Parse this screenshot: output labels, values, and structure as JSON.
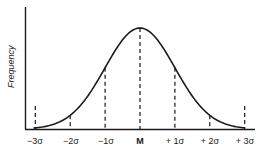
{
  "chart_data": {
    "type": "line",
    "title": "",
    "xlabel": "",
    "ylabel": "Frequency",
    "categories": [
      "-3σ",
      "-2σ",
      "-1σ",
      "M",
      "+1σ",
      "+2σ",
      "+3σ"
    ],
    "x": [
      -3,
      -2,
      -1,
      0,
      1,
      2,
      3
    ],
    "series": [
      {
        "name": "Normal curve",
        "values": [
          0.004,
          0.054,
          0.242,
          0.399,
          0.242,
          0.054,
          0.004
        ]
      }
    ],
    "xlim": [
      -3.3,
      3.1
    ],
    "ylim": [
      0,
      0.42
    ],
    "grid": false,
    "legend": "none",
    "annotations": [
      "Dashed vertical lines at each σ mark and the mean M"
    ]
  },
  "labels": {
    "ylabel": "Frequency",
    "ticks": [
      "−3σ",
      "−2σ",
      "−1σ",
      "M",
      "+ 1σ",
      "+ 2σ",
      "+ 3σ"
    ]
  }
}
